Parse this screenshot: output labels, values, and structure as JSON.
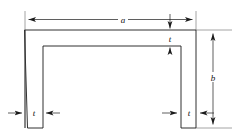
{
  "figure": {
    "background_color": "#ffffff",
    "line_color": "#1a1a1a",
    "label_color": "#111111"
  },
  "labels": {
    "overall_width": "a",
    "overall_depth": "b",
    "thickness_top": "t",
    "thickness_left_leg": "t",
    "thickness_right_leg": "t"
  },
  "dimensions": [
    {
      "name": "overall-width",
      "symbol": "a",
      "orientation": "horizontal",
      "position": "top",
      "arrowheads": "both"
    },
    {
      "name": "overall-depth",
      "symbol": "b",
      "orientation": "vertical",
      "position": "right",
      "arrowheads": "both"
    },
    {
      "name": "top-flange-thickness",
      "symbol": "t",
      "orientation": "vertical",
      "position": "top-center-right",
      "arrowheads": "both"
    },
    {
      "name": "left-leg-thickness",
      "symbol": "t",
      "orientation": "horizontal",
      "position": "bottom-left",
      "arrowheads": "both-inward"
    },
    {
      "name": "right-leg-thickness",
      "symbol": "t",
      "orientation": "horizontal",
      "position": "bottom-right",
      "arrowheads": "both-inward"
    }
  ]
}
